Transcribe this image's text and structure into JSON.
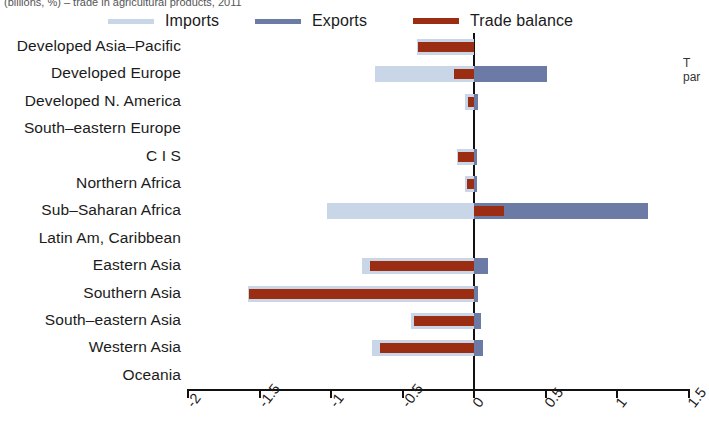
{
  "title_cropped": "(billions, %) – trade in agricultural products, 2011",
  "side_note_lines": [
    "T",
    "par"
  ],
  "legend": {
    "items": [
      {
        "label": "Imports",
        "color": "#c9d6e8",
        "key": "imports"
      },
      {
        "label": "Exports",
        "color": "#6b7ba6",
        "key": "exports"
      },
      {
        "label": "Trade balance",
        "color": "#9b2d12",
        "key": "balance"
      }
    ]
  },
  "axis": {
    "ticks": [
      "-2",
      "-1.5",
      "-1",
      "-0.5",
      "0",
      "0.5",
      "1",
      "1.5"
    ],
    "tick_values": [
      -2,
      -1.5,
      -1,
      -0.5,
      0,
      0.5,
      1,
      1.5
    ]
  },
  "chart_data": {
    "type": "bar",
    "orientation": "horizontal",
    "title": "(billions, %) – trade in agricultural products, 2011",
    "xlabel": "",
    "ylabel": "",
    "xlim": [
      -2,
      1.5
    ],
    "grid": false,
    "legend_position": "top",
    "categories": [
      "Developed Asia–Pacific",
      "Developed Europe",
      "Developed N. America",
      "South–eastern Europe",
      "C I S",
      "Northern Africa",
      "Sub–Saharan Africa",
      "Latin Am, Caribbean",
      "Eastern Asia",
      "Southern Asia",
      "South–eastern Asia",
      "Western Asia",
      "Oceania"
    ],
    "series": [
      {
        "name": "Imports",
        "color": "#c9d6e8",
        "values": [
          -0.4,
          -0.69,
          -0.06,
          0.0,
          -0.12,
          -0.06,
          -1.03,
          0.0,
          -0.78,
          -1.58,
          -0.44,
          -0.71,
          0.0
        ]
      },
      {
        "name": "Exports",
        "color": "#6b7ba6",
        "values": [
          0.0,
          0.51,
          0.03,
          0.0,
          0.01,
          0.01,
          1.22,
          0.0,
          0.1,
          0.03,
          0.05,
          0.06,
          0.0
        ]
      },
      {
        "name": "Trade balance",
        "color": "#9b2d12",
        "values": [
          -0.39,
          -0.14,
          -0.04,
          0.0,
          -0.11,
          -0.05,
          0.21,
          0.0,
          -0.73,
          -1.57,
          -0.42,
          -0.66,
          0.0
        ]
      }
    ]
  }
}
